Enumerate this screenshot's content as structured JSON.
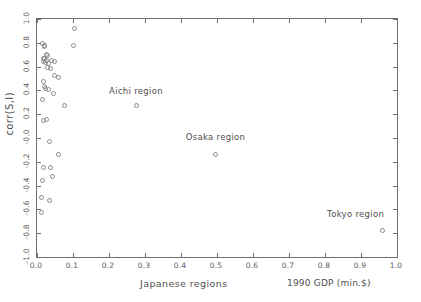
{
  "chart_data": {
    "type": "scatter",
    "title": "",
    "xlabel": "Japanese regions",
    "xlabel_units": "1990 GDP (min.$)",
    "ylabel": "corr(S,I)",
    "xlim": [
      0.0,
      1.0
    ],
    "ylim": [
      -1.0,
      1.0
    ],
    "grid": false,
    "legend": "none",
    "xticks": [
      "0.0",
      "0.1",
      "0.2",
      "0.3",
      "0.4",
      "0.5",
      "0.6",
      "0.7",
      "0.8",
      "0.9",
      "1.0"
    ],
    "xtick_values": [
      0.0,
      0.1,
      0.2,
      0.3,
      0.4,
      0.5,
      0.6,
      0.7,
      0.8,
      0.9,
      1.0
    ],
    "yticks": [
      "1.0",
      "0.8",
      "0.6",
      "0.4",
      "0.2",
      "-0.0",
      "-0.2",
      "-0.4",
      "-0.6",
      "-0.8",
      "-1.0"
    ],
    "ytick_values": [
      1.0,
      0.8,
      0.6,
      0.4,
      0.2,
      -0.0,
      -0.2,
      -0.4,
      -0.6,
      -0.8,
      -1.0
    ],
    "marker": "open-circle",
    "marker_color": "#8a8a8a",
    "points": [
      {
        "x": 0.105,
        "y": 0.92
      },
      {
        "x": 0.1,
        "y": 0.78
      },
      {
        "x": 0.015,
        "y": 0.79
      },
      {
        "x": 0.022,
        "y": 0.78
      },
      {
        "x": 0.02,
        "y": 0.765
      },
      {
        "x": 0.026,
        "y": 0.7
      },
      {
        "x": 0.03,
        "y": 0.69
      },
      {
        "x": 0.017,
        "y": 0.67
      },
      {
        "x": 0.022,
        "y": 0.665
      },
      {
        "x": 0.027,
        "y": 0.655
      },
      {
        "x": 0.019,
        "y": 0.645
      },
      {
        "x": 0.024,
        "y": 0.635
      },
      {
        "x": 0.033,
        "y": 0.625
      },
      {
        "x": 0.041,
        "y": 0.655
      },
      {
        "x": 0.048,
        "y": 0.64
      },
      {
        "x": 0.029,
        "y": 0.595
      },
      {
        "x": 0.037,
        "y": 0.58
      },
      {
        "x": 0.048,
        "y": 0.525
      },
      {
        "x": 0.061,
        "y": 0.505
      },
      {
        "x": 0.019,
        "y": 0.475
      },
      {
        "x": 0.021,
        "y": 0.435
      },
      {
        "x": 0.023,
        "y": 0.415
      },
      {
        "x": 0.032,
        "y": 0.405
      },
      {
        "x": 0.046,
        "y": 0.375
      },
      {
        "x": 0.015,
        "y": 0.325
      },
      {
        "x": 0.077,
        "y": 0.275
      },
      {
        "x": 0.275,
        "y": 0.275
      },
      {
        "x": 0.018,
        "y": 0.145
      },
      {
        "x": 0.026,
        "y": 0.155
      },
      {
        "x": 0.035,
        "y": -0.03
      },
      {
        "x": 0.059,
        "y": -0.135
      },
      {
        "x": 0.496,
        "y": -0.135
      },
      {
        "x": 0.017,
        "y": -0.245
      },
      {
        "x": 0.038,
        "y": -0.245
      },
      {
        "x": 0.015,
        "y": -0.36
      },
      {
        "x": 0.043,
        "y": -0.325
      },
      {
        "x": 0.013,
        "y": -0.5
      },
      {
        "x": 0.035,
        "y": -0.525
      },
      {
        "x": 0.013,
        "y": -0.625
      },
      {
        "x": 0.96,
        "y": -0.775
      }
    ],
    "annotations": [
      {
        "label": "Aichi region",
        "x": 0.275,
        "y": 0.39,
        "point": {
          "x": 0.275,
          "y": 0.275
        }
      },
      {
        "label": "Osaka region",
        "x": 0.496,
        "y": 0.0,
        "point": {
          "x": 0.496,
          "y": -0.135
        }
      },
      {
        "label": "Tokyo region",
        "x": 0.885,
        "y": -0.645,
        "point": {
          "x": 0.96,
          "y": -0.775
        }
      }
    ]
  }
}
